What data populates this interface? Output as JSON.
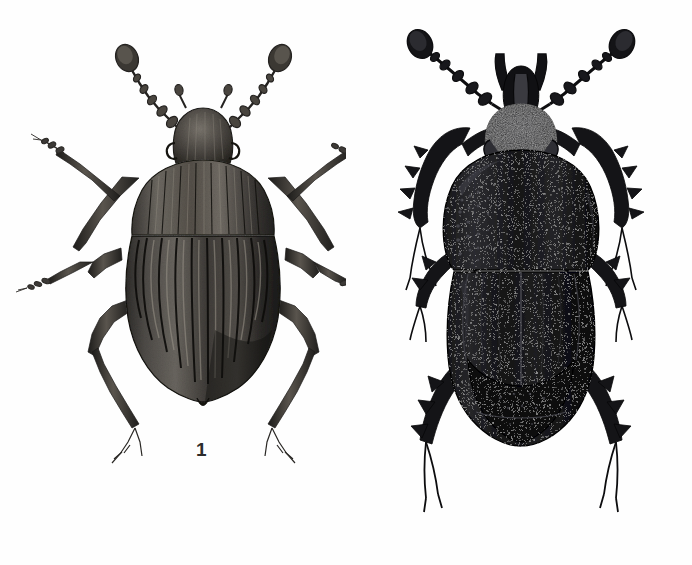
{
  "plate": {
    "title": "Two beetles in dorsal view (scientific illustration plate)",
    "background_color": "#fefefe",
    "ink_color": "#1a1a1a",
    "width": 692,
    "height": 565
  },
  "figures": [
    {
      "number": "1",
      "label": "1",
      "label_x": 196,
      "label_y": 440,
      "view": "dorsal",
      "description": "Beetle with strongly longitudinally striate (ribbed) elytra, ovoid body, narrow pronotum, clubbed antennae, long slender legs with multi-segmented tarsi",
      "tone": "medium grey-black engraving with highlights",
      "body_center_x": 204,
      "body_center_y": 265,
      "body_width": 160,
      "body_height": 250,
      "elytra_stria_count": 11
    },
    {
      "number": "2",
      "label": "2",
      "label_x": 509,
      "label_y": 511,
      "view": "dorsal",
      "description": "Robust dark scarab-like beetle with broad transverse pronotum, granulate punctate surface, horned clypeus, lamellate clubbed antennae and broad toothed (serrate) tibiae",
      "tone": "very dark, near solid black with granular texture",
      "body_center_x": 515,
      "body_center_y": 290,
      "body_width": 190,
      "body_height": 300
    }
  ]
}
